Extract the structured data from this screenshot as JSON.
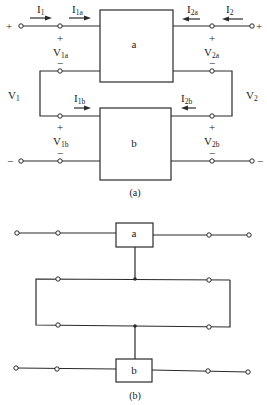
{
  "figure_a": {
    "caption": "(a)",
    "box_a_label": "a",
    "box_b_label": "b",
    "currents": {
      "I1": {
        "main": "I",
        "sub": "1"
      },
      "I1a": {
        "main": "I",
        "sub": "1a"
      },
      "I2a": {
        "main": "I",
        "sub": "2a"
      },
      "I2": {
        "main": "I",
        "sub": "2"
      },
      "I1b": {
        "main": "I",
        "sub": "1b"
      },
      "I2b": {
        "main": "I",
        "sub": "2b"
      }
    },
    "voltages": {
      "V1": {
        "main": "V",
        "sub": "1"
      },
      "V2": {
        "main": "V",
        "sub": "2"
      },
      "V1a": {
        "main": "V",
        "sub": "1a"
      },
      "V2a": {
        "main": "V",
        "sub": "2a"
      },
      "V1b": {
        "main": "V",
        "sub": "1b"
      },
      "V2b": {
        "main": "V",
        "sub": "2b"
      }
    },
    "signs": {
      "plus": "+",
      "minus": "−"
    }
  },
  "figure_b": {
    "caption": "(b)",
    "box_a_label": "a",
    "box_b_label": "b"
  }
}
